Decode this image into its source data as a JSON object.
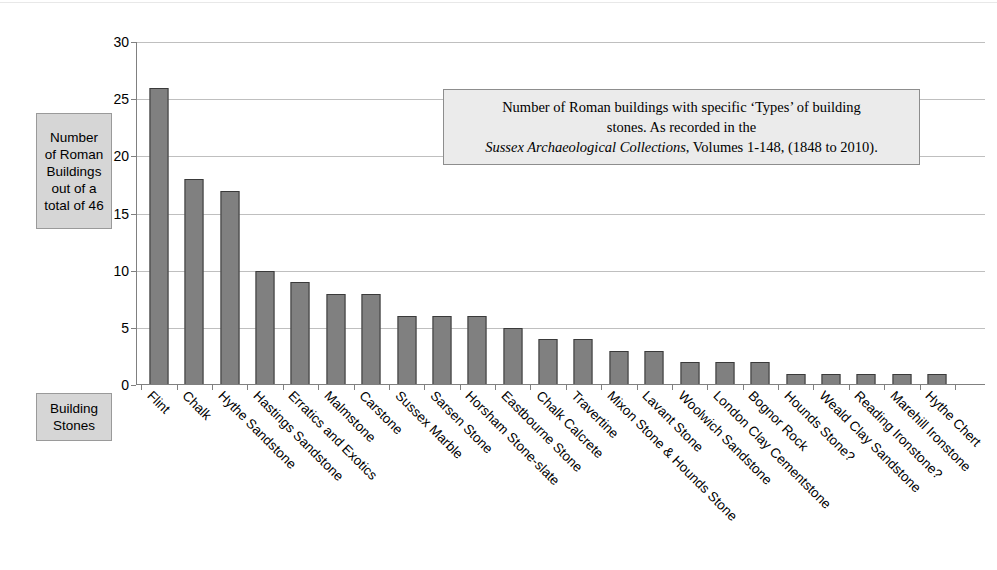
{
  "axis_titles": {
    "y_label": "Number\nof Roman\nBuildings\nout of a\ntotal of 46",
    "x_label": "Building\nStones"
  },
  "annotation": {
    "line1": "Number of Roman buildings with specific ‘Types’ of building",
    "line2": "stones. As recorded in the",
    "line3_italic": "Sussex Archaeological Collections",
    "line3_rest": ", Volumes 1-148, (1848 to 2010)."
  },
  "colors": {
    "bar_fill": "#808080",
    "bar_border": "#3a3a3a",
    "gridline": "#bfbfbf",
    "label_box_fill": "#d6d6d6",
    "annotation_fill": "#ebebeb"
  },
  "chart_data": {
    "type": "bar",
    "title": "Number of Roman buildings with specific ‘Types’ of building stones. As recorded in the Sussex Archaeological Collections, Volumes 1-148, (1848 to 2010).",
    "xlabel": "Building Stones",
    "ylabel": "Number of Roman Buildings out of a total of 46",
    "ylim": [
      0,
      30
    ],
    "yticks": [
      0,
      5,
      10,
      15,
      20,
      25,
      30
    ],
    "grid": true,
    "legend": false,
    "categories": [
      "Flint",
      "Chalk",
      "Hythe Sandstone",
      "Hastings Sandstone",
      "Erratics and Exotics",
      "Malmstone",
      "Carstone",
      "Sussex Marble",
      "Sarsen Stone",
      "Horsham Stone-slate",
      "Eastbourne Stone",
      "Chalk Calcrete",
      "Travertine",
      "Mixon Stone & Hounds Stone",
      "Lavant Stone",
      "Woolwich Sandstone",
      "London Clay Cementstone",
      "Bognor Rock",
      "Hounds Stone?",
      "Weald Clay Sandstone",
      "Reading Ironstone?",
      "Marehill Ironstone",
      "Hythe Chert"
    ],
    "values": [
      26,
      18,
      17,
      10,
      9,
      8,
      8,
      6,
      6,
      6,
      5,
      4,
      4,
      3,
      3,
      2,
      2,
      2,
      1,
      1,
      1,
      1,
      1
    ]
  }
}
